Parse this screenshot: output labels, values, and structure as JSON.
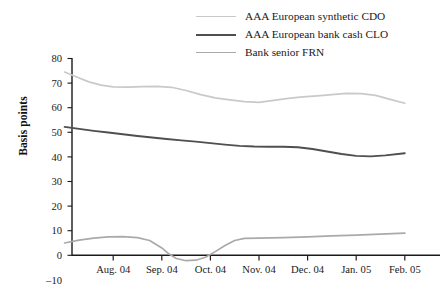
{
  "chart_data": {
    "type": "line",
    "title": "",
    "xlabel": "",
    "ylabel": "Basis points",
    "categories": [
      "Aug. 04",
      "Sep. 04",
      "Oct. 04",
      "Nov. 04",
      "Dec. 04",
      "Jan. 05",
      "Feb. 05"
    ],
    "x_tick_labels": [
      "Aug. 04",
      "Sep. 04",
      "Oct. 04",
      "Nov. 04",
      "Dec. 04",
      "Jan. 05",
      "Feb. 05"
    ],
    "y_tick_labels": [
      "80",
      "70",
      "60",
      "50",
      "40",
      "30",
      "20",
      "10",
      "0",
      "–10"
    ],
    "y_tick_values": [
      80,
      70,
      60,
      50,
      40,
      30,
      20,
      10,
      0,
      -10
    ],
    "ylim": [
      -10,
      80
    ],
    "grid": false,
    "legend_position": "top-right",
    "series": [
      {
        "name": "AAA European synthetic CDO",
        "color": "#c9c9c9",
        "width": 1.7,
        "x": [
          0.0,
          0.25,
          0.5,
          0.75,
          1.0,
          1.3,
          1.6,
          1.9,
          2.2,
          2.5,
          2.8,
          3.1,
          3.4,
          3.7,
          4.0,
          4.3,
          4.6,
          4.9,
          5.2,
          5.5,
          5.8,
          6.1,
          6.4,
          6.7,
          7.0
        ],
        "y": [
          74.5,
          72.5,
          70.5,
          69.2,
          68.5,
          68.4,
          68.6,
          68.7,
          68.3,
          67.0,
          65.3,
          64.0,
          63.2,
          62.5,
          62.2,
          63.0,
          63.8,
          64.4,
          64.8,
          65.3,
          65.8,
          65.7,
          65.0,
          63.4,
          61.8
        ]
      },
      {
        "name": "AAA European bank cash CLO",
        "color": "#4f4f4f",
        "width": 1.9,
        "x": [
          0.0,
          0.3,
          0.6,
          0.9,
          1.2,
          1.5,
          1.8,
          2.1,
          2.4,
          2.7,
          3.0,
          3.3,
          3.6,
          3.9,
          4.2,
          4.5,
          4.8,
          5.1,
          5.4,
          5.7,
          6.0,
          6.3,
          6.6,
          7.0
        ],
        "y": [
          52.2,
          51.4,
          50.6,
          49.9,
          49.2,
          48.5,
          47.9,
          47.3,
          46.7,
          46.2,
          45.6,
          45.0,
          44.5,
          44.2,
          44.1,
          44.1,
          43.9,
          43.2,
          42.2,
          41.2,
          40.4,
          40.2,
          40.6,
          41.5
        ]
      },
      {
        "name": "Bank senior FRN",
        "color": "#aaaaaa",
        "width": 1.7,
        "x": [
          0.0,
          0.3,
          0.6,
          0.9,
          1.2,
          1.5,
          1.75,
          2.0,
          2.15,
          2.3,
          2.5,
          2.7,
          2.9,
          3.1,
          3.3,
          3.5,
          3.7,
          4.0,
          4.5,
          5.0,
          5.5,
          6.0,
          6.5,
          7.0
        ],
        "y": [
          5.0,
          6.2,
          7.0,
          7.5,
          7.6,
          7.2,
          6.0,
          3.0,
          0.5,
          -1.3,
          -2.2,
          -2.0,
          -0.8,
          1.5,
          4.0,
          6.0,
          6.9,
          7.0,
          7.2,
          7.5,
          7.9,
          8.2,
          8.6,
          9.0
        ]
      }
    ]
  },
  "legend": {
    "items": [
      {
        "label": "AAA European synthetic CDO",
        "color": "#c9c9c9",
        "width": 1.7
      },
      {
        "label": "AAA European bank cash CLO",
        "color": "#4f4f4f",
        "width": 2.4
      },
      {
        "label": "Bank senior FRN",
        "color": "#aaaaaa",
        "width": 1.7
      }
    ]
  },
  "axes": {
    "y_axis_label": "Basis points",
    "axis_color": "#1a1a1a"
  }
}
